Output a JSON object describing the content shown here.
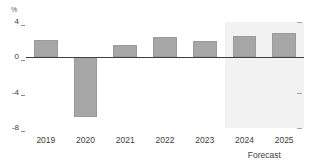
{
  "chart_data": {
    "type": "bar",
    "title": "",
    "subtitle": "",
    "xlabel": "",
    "ylabel": "%",
    "unit_label": "%",
    "categories": [
      "2019",
      "2020",
      "2021",
      "2022",
      "2023",
      "2024",
      "2025"
    ],
    "values": [
      2.0,
      -6.7,
      1.4,
      2.3,
      1.8,
      2.4,
      2.7
    ],
    "ylim": [
      -8,
      4
    ],
    "yticks": [
      4,
      0,
      -4,
      -8
    ],
    "ytick_labels": [
      "4",
      "0",
      "-4",
      "-8"
    ],
    "grid": false,
    "legend": null,
    "series": [
      {
        "name": "",
        "values": [
          2.0,
          -6.7,
          1.4,
          2.3,
          1.8,
          2.4,
          2.7
        ]
      }
    ],
    "annotations": [
      {
        "text": "Forecast",
        "applies_to": [
          "2024",
          "2025"
        ],
        "position": "below-axis"
      }
    ],
    "forecast": {
      "label": "Forecast",
      "categories": [
        "2024",
        "2025"
      ],
      "start_index": 5,
      "end_index": 6,
      "shade_color": "#f2f2f2"
    },
    "colors": {
      "bar_fill": "#a6a6a6",
      "bar_stroke": "#9a9a9a",
      "zero_line": "#404040",
      "tick_text": "#404040",
      "unit_text": "#595959",
      "axis_tick": "#8c8c8c",
      "forecast_shade": "#f2f2f2",
      "background": "#ffffff"
    }
  }
}
